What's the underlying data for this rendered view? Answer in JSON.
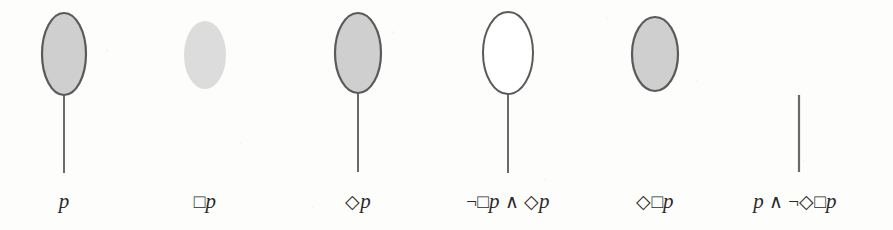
{
  "figure": {
    "name": "modal-logic-kripke-worlds-diagram",
    "width": 893,
    "height": 230,
    "background_color": "#fdfdfc",
    "ink_color": "#4a4a4a",
    "label_color": "#2a2a2a"
  },
  "legend": {
    "filled_shaded_color": "#cfcfcf",
    "soft_shaded_color": "#d9d9d9",
    "unfilled_color": "#ffffff",
    "outline_color": "#5a5a5a",
    "stem_color": "#6a6a6a"
  },
  "worlds": [
    {
      "id": "world-1",
      "label": "p",
      "label_parts": [
        {
          "kind": "var",
          "text": "p"
        }
      ],
      "center_x": 64,
      "ellipse": {
        "present": true,
        "cx": 64,
        "cy": 54,
        "rx": 22,
        "ry": 41,
        "fill": "#cfcfcf",
        "stroke": "#5a5a5a",
        "stroke_width": 2.2
      },
      "stem": {
        "present": true,
        "x": 64,
        "y_top": 95,
        "y_bottom": 173,
        "color": "#6a6a6a",
        "width": 2.0
      },
      "label_x": 64,
      "label_y": 189
    },
    {
      "id": "world-2",
      "label": "□p",
      "label_parts": [
        {
          "kind": "op",
          "text": "□"
        },
        {
          "kind": "var",
          "text": "p"
        }
      ],
      "center_x": 205,
      "ellipse": {
        "present": true,
        "cx": 205,
        "cy": 55,
        "rx": 21,
        "ry": 34,
        "fill": "#dcdcdc",
        "stroke": "none",
        "stroke_width": 0
      },
      "stem": {
        "present": false,
        "x": 205,
        "y_top": 0,
        "y_bottom": 0,
        "color": "#6a6a6a",
        "width": 2.0
      },
      "label_x": 205,
      "label_y": 189
    },
    {
      "id": "world-3",
      "label": "◇p",
      "label_parts": [
        {
          "kind": "op",
          "text": "◇"
        },
        {
          "kind": "var",
          "text": "p"
        }
      ],
      "center_x": 358,
      "ellipse": {
        "present": true,
        "cx": 358,
        "cy": 53,
        "rx": 23,
        "ry": 40,
        "fill": "#cfcfcf",
        "stroke": "#5a5a5a",
        "stroke_width": 2.2
      },
      "stem": {
        "present": true,
        "x": 358,
        "y_top": 93,
        "y_bottom": 172,
        "color": "#6a6a6a",
        "width": 2.0
      },
      "label_x": 358,
      "label_y": 189
    },
    {
      "id": "world-4",
      "label": "¬□p ∧ ◇p",
      "label_parts": [
        {
          "kind": "op",
          "text": "¬"
        },
        {
          "kind": "op",
          "text": "□"
        },
        {
          "kind": "var",
          "text": "p"
        },
        {
          "kind": "op",
          "text": " ∧ "
        },
        {
          "kind": "op",
          "text": "◇"
        },
        {
          "kind": "var",
          "text": "p"
        }
      ],
      "center_x": 508,
      "ellipse": {
        "present": true,
        "cx": 508,
        "cy": 53,
        "rx": 25,
        "ry": 41,
        "fill": "#ffffff",
        "stroke": "#5a5a5a",
        "stroke_width": 2.0
      },
      "stem": {
        "present": true,
        "x": 508,
        "y_top": 94,
        "y_bottom": 173,
        "color": "#6a6a6a",
        "width": 2.0
      },
      "label_x": 508,
      "label_y": 189
    },
    {
      "id": "world-5",
      "label": "◇□p",
      "label_parts": [
        {
          "kind": "op",
          "text": "◇"
        },
        {
          "kind": "op",
          "text": "□"
        },
        {
          "kind": "var",
          "text": "p"
        }
      ],
      "center_x": 655,
      "ellipse": {
        "present": true,
        "cx": 655,
        "cy": 54,
        "rx": 23,
        "ry": 37,
        "fill": "#cfcfcf",
        "stroke": "#5a5a5a",
        "stroke_width": 2.2
      },
      "stem": {
        "present": false,
        "x": 655,
        "y_top": 0,
        "y_bottom": 0,
        "color": "#6a6a6a",
        "width": 2.0
      },
      "label_x": 655,
      "label_y": 189
    },
    {
      "id": "world-6",
      "label": "p ∧ ¬◇□p",
      "label_parts": [
        {
          "kind": "var",
          "text": "p"
        },
        {
          "kind": "op",
          "text": " ∧ "
        },
        {
          "kind": "op",
          "text": "¬"
        },
        {
          "kind": "op",
          "text": "◇"
        },
        {
          "kind": "op",
          "text": "□"
        },
        {
          "kind": "var",
          "text": "p"
        }
      ],
      "center_x": 795,
      "ellipse": {
        "present": false,
        "cx": 799,
        "cy": 54,
        "rx": 0,
        "ry": 0,
        "fill": "none",
        "stroke": "none",
        "stroke_width": 0
      },
      "stem": {
        "present": true,
        "x": 799,
        "y_top": 95,
        "y_bottom": 172,
        "color": "#6a6a6a",
        "width": 2.2
      },
      "label_x": 795,
      "label_y": 189
    }
  ]
}
